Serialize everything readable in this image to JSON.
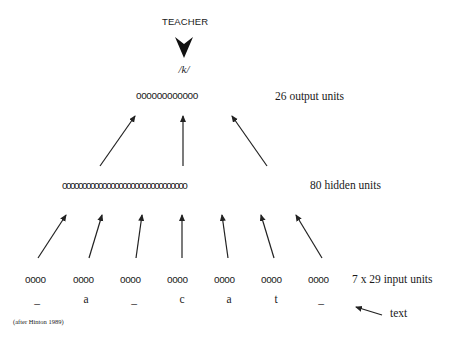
{
  "teacher": {
    "label": "TEACHER"
  },
  "target": {
    "phoneme": "/k/"
  },
  "layers": {
    "output": {
      "circles": "oooooooooooo",
      "label": "26 output units"
    },
    "hidden": {
      "circles": "ooooooooooooooooooooooooooooooo",
      "label": "80 hidden units"
    },
    "input": {
      "label": "7 x 29 input units",
      "groups": [
        {
          "circles": "oooo",
          "letter": "_"
        },
        {
          "circles": "oooo",
          "letter": "a"
        },
        {
          "circles": "oooo",
          "letter": "_"
        },
        {
          "circles": "oooo",
          "letter": "c"
        },
        {
          "circles": "oooo",
          "letter": "a"
        },
        {
          "circles": "oooo",
          "letter": "t"
        },
        {
          "circles": "oooo",
          "letter": "_"
        }
      ]
    }
  },
  "text_pointer": {
    "label": "text"
  },
  "credit": "(after Hinton 1989)"
}
